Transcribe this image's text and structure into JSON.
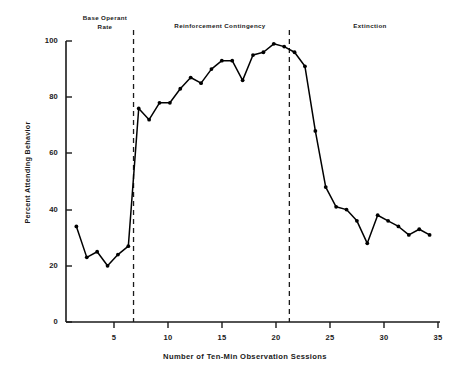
{
  "chart_data": {
    "type": "line",
    "title": "",
    "xlabel": "Number of Ten-Min Observation Sessions",
    "ylabel": "Percent Attending Behavior",
    "xlim": [
      0,
      36
    ],
    "ylim": [
      0,
      100
    ],
    "grid": false,
    "legend": "none",
    "marker": "filled-circle",
    "line_color": "#000000",
    "x": [
      1,
      2,
      3,
      4,
      5,
      6,
      7,
      8,
      9,
      10,
      11,
      12,
      13,
      14,
      15,
      16,
      17,
      18,
      19,
      20,
      21,
      22,
      23,
      24,
      25,
      26,
      27,
      28,
      29,
      30,
      31,
      32,
      33,
      34,
      35
    ],
    "values": [
      34,
      23,
      25,
      20,
      24,
      27,
      76,
      72,
      78,
      78,
      83,
      87,
      85,
      90,
      93,
      93,
      86,
      95,
      96,
      99,
      98,
      96,
      91,
      68,
      48,
      41,
      40,
      36,
      28,
      38,
      36,
      34,
      31,
      33,
      31
    ],
    "x_ticks": [
      5,
      10,
      15,
      20,
      25,
      30,
      35
    ],
    "x_tick_labels": [
      "5",
      "10",
      "15",
      "20",
      "25",
      "30",
      "35"
    ],
    "y_ticks": [
      0,
      20,
      40,
      60,
      80,
      100
    ],
    "y_tick_labels": [
      "0",
      "20",
      "40",
      "60",
      "80",
      "100"
    ],
    "phase_dividers": [
      6.5,
      21.5
    ],
    "phases": [
      {
        "id": "base",
        "label": "Base Operant\nRate",
        "x_center": 3.2
      },
      {
        "id": "reinforcement",
        "label": "Reinforcement  Contingency",
        "x_center": 14
      },
      {
        "id": "extinction",
        "label": "Extinction",
        "x_center": 29
      }
    ]
  }
}
